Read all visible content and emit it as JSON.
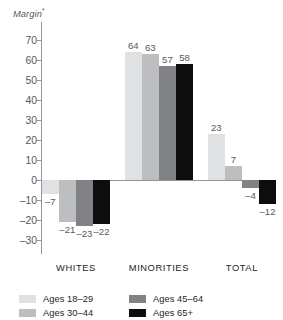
{
  "figure": {
    "title_fragment": "",
    "axis_caption": "Margin",
    "footnote_marker": "*"
  },
  "colors": {
    "series_18_29": "#e0e1e2",
    "series_30_44": "#bcbec0",
    "series_45_64": "#808285",
    "series_65_plus": "#0d0d0d",
    "axis": "#939598",
    "text": "#231f20",
    "muted_text": "#58595b",
    "background": "#ffffff"
  },
  "chart_data": {
    "type": "bar",
    "title": "",
    "xlabel": "",
    "ylabel": "Margin",
    "ylim": [
      -30,
      70
    ],
    "ytick_step": 10,
    "yticks": [
      70,
      60,
      50,
      40,
      30,
      20,
      10,
      0,
      -10,
      -20,
      -30
    ],
    "ytick_labels": [
      "70",
      "60",
      "50",
      "40",
      "30",
      "20",
      "10",
      "0",
      "-10",
      "-20",
      "-30"
    ],
    "grid": false,
    "zero_line": true,
    "legend_position": "bottom-left",
    "categories": [
      "WHITES",
      "MINORITIES",
      "TOTAL"
    ],
    "series": [
      {
        "name": "Ages 18-29",
        "label": "Ages 18–29",
        "color": "#e0e1e2",
        "values": [
          -7,
          64,
          23
        ],
        "value_labels": [
          "–7",
          "64",
          "23"
        ]
      },
      {
        "name": "Ages 30-44",
        "label": "Ages 30–44",
        "color": "#bcbec0",
        "values": [
          -21,
          63,
          7
        ],
        "value_labels": [
          "–21",
          "63",
          "7"
        ]
      },
      {
        "name": "Ages 45-64",
        "label": "Ages 45–64",
        "color": "#808285",
        "values": [
          -23,
          57,
          -4
        ],
        "value_labels": [
          "–23",
          "57",
          "–4"
        ]
      },
      {
        "name": "Ages 65+",
        "label": "Ages 65+",
        "color": "#0d0d0d",
        "values": [
          -22,
          58,
          -12
        ],
        "value_labels": [
          "–22",
          "58",
          "–12"
        ]
      }
    ]
  }
}
